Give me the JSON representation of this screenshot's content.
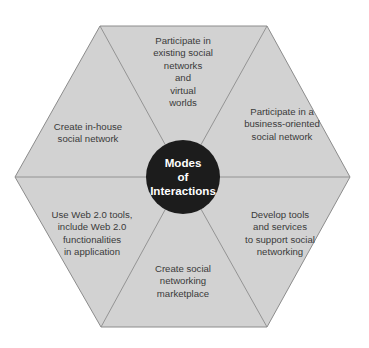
{
  "diagram": {
    "type": "hexagon-segments",
    "center": {
      "title": "Modes\nof\nInteractions"
    },
    "segments": [
      {
        "position": "top",
        "text": "Participate in\nexisting social\nnetworks\nand\nvirtual\nworlds"
      },
      {
        "position": "upper-right",
        "text": "Participate in a\nbusiness-oriented\nsocial network"
      },
      {
        "position": "lower-right",
        "text": "Develop tools\nand services\nto support social\nnetworking"
      },
      {
        "position": "bottom",
        "text": "Create social\nnetworking\nmarketplace"
      },
      {
        "position": "lower-left",
        "text": "Use Web 2.0 tools,\ninclude Web 2.0\nfunctionalities\nin application"
      },
      {
        "position": "upper-left",
        "text": "Create in-house\nsocial network"
      }
    ],
    "colors": {
      "hexagon_fill": "#d2d2d2",
      "hexagon_stroke": "#8c8c8c",
      "center_fill": "#1c1c1c",
      "center_text": "#ffffff",
      "segment_text": "#3a3a3a"
    }
  }
}
